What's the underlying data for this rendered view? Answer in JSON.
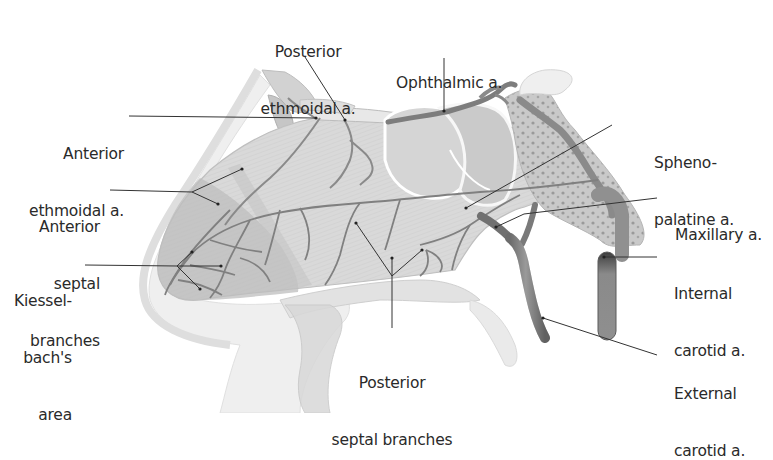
{
  "figure": {
    "colors": {
      "background": "#ffffff",
      "tissue_light": "#e6e6e6",
      "tissue_mid": "#cfcfcf",
      "septum": "#d6d6d6",
      "kiesselbach_area": "#bdbdbd",
      "vessel": "#8a8a8a",
      "vessel_dark": "#6a6a6a",
      "bone": "#b8b8b8",
      "leader_line": "#333333",
      "label_text": "#2a2a2a"
    }
  },
  "labels": {
    "posterior_ethmoidal": {
      "line1": "Posterior",
      "line2": "ethmoidal a."
    },
    "ophthalmic": {
      "line1": "Ophthalmic a."
    },
    "anterior_ethmoidal": {
      "line1": "Anterior",
      "line2": "ethmoidal a."
    },
    "sphenopalatine": {
      "line1": "Spheno-",
      "line2": "palatine a."
    },
    "anterior_septal": {
      "line1": "Anterior",
      "line2": "septal",
      "line3": "branches"
    },
    "maxillary": {
      "line1": "Maxillary a."
    },
    "kiesselbach": {
      "line1": "Kiessel-",
      "line2": "bach's",
      "line3": "area"
    },
    "internal_carotid": {
      "line1": "Internal",
      "line2": "carotid a."
    },
    "posterior_septal": {
      "line1": "Posterior",
      "line2": "septal branches"
    },
    "external_carotid": {
      "line1": "External",
      "line2": "carotid a."
    }
  }
}
